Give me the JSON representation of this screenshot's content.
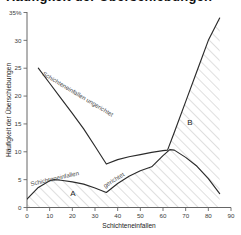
{
  "title": "Häufigkeit der Überschiebungen",
  "axis_label_y": "Häufigkeit der Überschiebungen",
  "axis_label_x": "Schichteneinfallen",
  "y_ticks": [
    "0",
    "5",
    "10",
    "15",
    "20",
    "25",
    "30",
    "35%"
  ],
  "x_ticks": [
    "0",
    "10",
    "20",
    "30",
    "40",
    "50",
    "60",
    "70",
    "80",
    "90"
  ],
  "region_a_label": "A",
  "region_b_label": "B",
  "curve_label_ungerichtet": "Schichteneinfallen ungerichtet",
  "curve_label_gerichtet_1": "Schichteneinfallen",
  "curve_label_gerichtet_2": "gerichtet",
  "colors": {
    "curve": "#2b2b2b",
    "hatch": "#b8b8b8",
    "axis": "#666666",
    "text": "#1a1a1a"
  },
  "chart_data": {
    "type": "line",
    "title": "Häufigkeit der Überschiebungen",
    "xlabel": "Schichteneinfallen",
    "ylabel": "Häufigkeit der Überschiebungen",
    "xlim": [
      0,
      90
    ],
    "ylim": [
      0,
      35
    ],
    "grid": false,
    "legend_position": "inline-annotations",
    "annotations": [
      {
        "text": "A",
        "x": 22,
        "y": 2.0
      },
      {
        "text": "B",
        "x": 72,
        "y": 15.5
      },
      {
        "text": "Schichteneinfallen ungerichtet",
        "x": 18,
        "y": 20.0
      },
      {
        "text": "Schichteneinfallen",
        "x": 8,
        "y": 5.6
      },
      {
        "text": "gerichtet",
        "x": 38,
        "y": 4.6
      }
    ],
    "series": [
      {
        "name": "Schichteneinfallen ungerichtet",
        "x": [
          5,
          10,
          15,
          20,
          25,
          30,
          35,
          40,
          45,
          50,
          55,
          60,
          62,
          65,
          70,
          75,
          80,
          85
        ],
        "values": [
          25.0,
          22.3,
          19.6,
          16.9,
          14.1,
          11.0,
          7.8,
          8.6,
          9.1,
          9.5,
          9.9,
          10.2,
          10.3,
          13.5,
          19.0,
          24.5,
          30.0,
          34.0
        ]
      },
      {
        "name": "Schichteneinfallen gerichtet",
        "x": [
          0,
          5,
          10,
          12,
          15,
          20,
          25,
          30,
          35,
          40,
          45,
          50,
          55,
          60,
          63,
          65,
          70,
          75,
          80,
          85
        ],
        "values": [
          1.5,
          3.6,
          4.8,
          5.0,
          4.9,
          4.6,
          4.2,
          3.5,
          2.7,
          4.3,
          5.6,
          6.6,
          7.3,
          9.3,
          10.4,
          10.3,
          9.0,
          7.4,
          5.2,
          2.5
        ]
      }
    ]
  }
}
